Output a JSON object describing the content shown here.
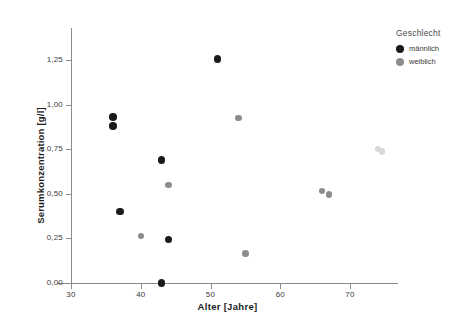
{
  "chart_data": {
    "type": "scatter",
    "title": "",
    "xlabel": "Alter [Jahre]",
    "ylabel": "Serumkonzentration [g/l]",
    "xlim": [
      27,
      76
    ],
    "ylim": [
      0.0,
      1.33
    ],
    "xticks": [
      "30",
      "40",
      "50",
      "60",
      "70"
    ],
    "xtick_values": [
      30,
      40,
      50,
      60,
      70
    ],
    "yticks": [
      "0,00",
      "0,25",
      "0,50",
      "0,75",
      "1,00",
      "1,25"
    ],
    "ytick_values": [
      0.0,
      0.25,
      0.5,
      0.75,
      1.0,
      1.25
    ],
    "grid": false,
    "legend_position": "top-right",
    "legend_title": "Geschlecht",
    "series": [
      {
        "name": "männlich",
        "color": "#1a1a1a",
        "marker": "circle",
        "points": [
          {
            "x": 36.0,
            "y": 0.93
          },
          {
            "x": 36.0,
            "y": 0.88
          },
          {
            "x": 37.0,
            "y": 0.4
          },
          {
            "x": 43.0,
            "y": 0.69
          },
          {
            "x": 44.0,
            "y": 0.245
          },
          {
            "x": 43.0,
            "y": 0.0
          },
          {
            "x": 51.0,
            "y": 1.255
          }
        ]
      },
      {
        "name": "weiblich",
        "color": "#8c8c8c",
        "marker": "circle",
        "points": [
          {
            "x": 40.0,
            "y": 0.265
          },
          {
            "x": 44.0,
            "y": 0.55
          },
          {
            "x": 54.0,
            "y": 0.925
          },
          {
            "x": 55.0,
            "y": 0.165
          },
          {
            "x": 66.0,
            "y": 0.515
          },
          {
            "x": 67.0,
            "y": 0.495
          },
          {
            "x": 74.0,
            "y": 0.75
          },
          {
            "x": 74.6,
            "y": 0.738
          }
        ]
      }
    ]
  },
  "axes": {
    "x_title": "Alter [Jahre]",
    "y_title": "Serumkonzentration [g/l]",
    "x_tick_labels": [
      "30",
      "40",
      "50",
      "60",
      "70"
    ],
    "y_tick_labels": [
      "0,00",
      "0,25",
      "0,50",
      "0,75",
      "1,00",
      "1,25"
    ]
  },
  "legend": {
    "title": "Geschlecht",
    "entries": [
      {
        "label": "männlich",
        "color": "#1a1a1a"
      },
      {
        "label": "weiblich",
        "color": "#8c8c8c"
      }
    ]
  },
  "colors": {
    "male": "#1a1a1a",
    "female": "#8c8c8c",
    "axis": "#8a8a8a",
    "text": "#3b3b3b",
    "background": "#ffffff"
  }
}
